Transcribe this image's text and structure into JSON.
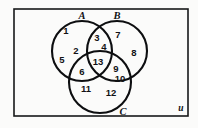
{
  "diagram": {
    "type": "venn-3-set",
    "title": "",
    "universe": {
      "label": "u",
      "x": 181,
      "y": 109
    },
    "frame": {
      "x": 14,
      "y": 9,
      "width": 174,
      "height": 107,
      "stroke": "#17181a"
    },
    "sets": [
      {
        "name": "A",
        "label": "A",
        "cx": 82,
        "cy": 51,
        "r": 30,
        "label_x": 82,
        "label_y": 17
      },
      {
        "name": "B",
        "label": "B",
        "cx": 117,
        "cy": 51,
        "r": 30,
        "label_x": 117,
        "label_y": 17
      },
      {
        "name": "C",
        "label": "C",
        "cx": 100,
        "cy": 82,
        "r": 31,
        "label_x": 123,
        "label_y": 113
      }
    ],
    "regions": [
      {
        "id": "r1",
        "label": "1",
        "x": 66,
        "y": 31,
        "belongs": "A only"
      },
      {
        "id": "r2",
        "label": "2",
        "x": 76,
        "y": 51,
        "belongs": "A only"
      },
      {
        "id": "r5",
        "label": "5",
        "x": 62,
        "y": 60,
        "belongs": "A only"
      },
      {
        "id": "r3",
        "label": "3",
        "x": 97,
        "y": 38,
        "belongs": "A and B"
      },
      {
        "id": "r4",
        "label": "4",
        "x": 104,
        "y": 47,
        "belongs": "A and B"
      },
      {
        "id": "r7",
        "label": "7",
        "x": 118,
        "y": 35,
        "belongs": "B only"
      },
      {
        "id": "r8",
        "label": "8",
        "x": 134,
        "y": 53,
        "belongs": "B only"
      },
      {
        "id": "r13",
        "label": "13",
        "x": 98,
        "y": 62,
        "belongs": "A and B and C"
      },
      {
        "id": "r6",
        "label": "6",
        "x": 82,
        "y": 72,
        "belongs": "A and C"
      },
      {
        "id": "r9",
        "label": "9",
        "x": 116,
        "y": 69,
        "belongs": "B and C"
      },
      {
        "id": "r10",
        "label": "10",
        "x": 120,
        "y": 79,
        "belongs": "B and C"
      },
      {
        "id": "r11",
        "label": "11",
        "x": 86,
        "y": 89,
        "belongs": "C only"
      },
      {
        "id": "r12",
        "label": "12",
        "x": 111,
        "y": 93,
        "belongs": "C only"
      }
    ]
  }
}
